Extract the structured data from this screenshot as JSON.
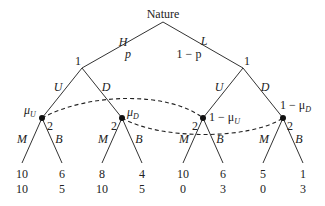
{
  "root": {
    "label": "Nature"
  },
  "nature_moves": {
    "left": {
      "action": "H",
      "prob": "p"
    },
    "right": {
      "action": "L",
      "prob": "1 − p"
    }
  },
  "player1": {
    "left": {
      "label": "1",
      "up": "U",
      "down": "D"
    },
    "right": {
      "label": "1",
      "up": "U",
      "down": "D"
    }
  },
  "player2_nodes": [
    {
      "player": "2",
      "belief": "μ",
      "belief_sub": "U",
      "m": "M",
      "b": "B"
    },
    {
      "player": "2",
      "belief": "μ",
      "belief_sub": "D",
      "m": "M",
      "b": "B"
    },
    {
      "player": "2",
      "belief": "1 − μ",
      "belief_sub": "U",
      "m": "M",
      "b": "B"
    },
    {
      "player": "2",
      "belief": "1 − μ",
      "belief_sub": "D",
      "m": "M",
      "b": "B"
    }
  ],
  "payoffs": [
    {
      "p1": "10",
      "p2": "10"
    },
    {
      "p1": "6",
      "p2": "5"
    },
    {
      "p1": "8",
      "p2": "10"
    },
    {
      "p1": "4",
      "p2": "5"
    },
    {
      "p1": "10",
      "p2": "0"
    },
    {
      "p1": "6",
      "p2": "3"
    },
    {
      "p1": "5",
      "p2": "0"
    },
    {
      "p1": "1",
      "p2": "3"
    }
  ]
}
